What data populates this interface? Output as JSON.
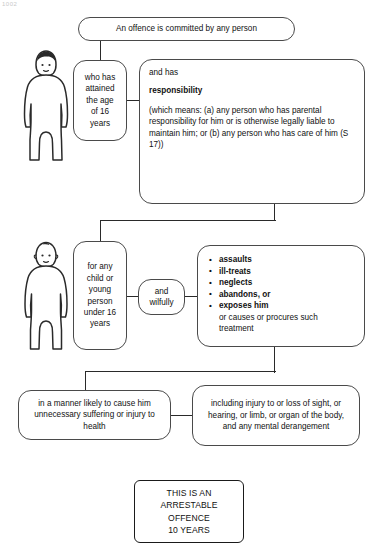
{
  "artifact": {
    "corner_text": "1002"
  },
  "diagram": {
    "title_box": {
      "text": "An offence is committed by any person"
    },
    "row1": {
      "person_label": "person-figure-adult",
      "age_box": {
        "text": "who has attained the age of 16 years"
      },
      "responsibility_box": {
        "intro": "and has",
        "keyword": "responsibility",
        "definition": "(which means: (a) any person who has parental responsibility for him or is otherwise legally liable to maintain him; or (b) any person who has care of him (S 17))"
      }
    },
    "row2": {
      "person_label": "person-figure-child-carer",
      "child_box": {
        "text": "for any child or young person under 16 years"
      },
      "wilfully_box": {
        "text": "and wilfully"
      },
      "acts_box": {
        "bullets": [
          "assaults",
          "ill-treats",
          "neglects",
          "abandons, or",
          "exposes him"
        ],
        "tail": "or causes or procures such treatment"
      }
    },
    "row3": {
      "manner_box": {
        "text": "in a manner likely to cause him unnecessary suffering or injury to health"
      },
      "injury_box": {
        "text": "including injury to or loss of sight, or hearing, or limb, or organ of the body, and any mental derangement"
      }
    },
    "final_box": {
      "line1": "THIS IS AN",
      "line2": "ARRESTABLE",
      "line3": "OFFENCE",
      "line4": "10 YEARS"
    }
  },
  "colors": {
    "stroke": "#4a4a4a",
    "connector": "#2a2a2a",
    "text": "#111111",
    "background": "#ffffff"
  }
}
